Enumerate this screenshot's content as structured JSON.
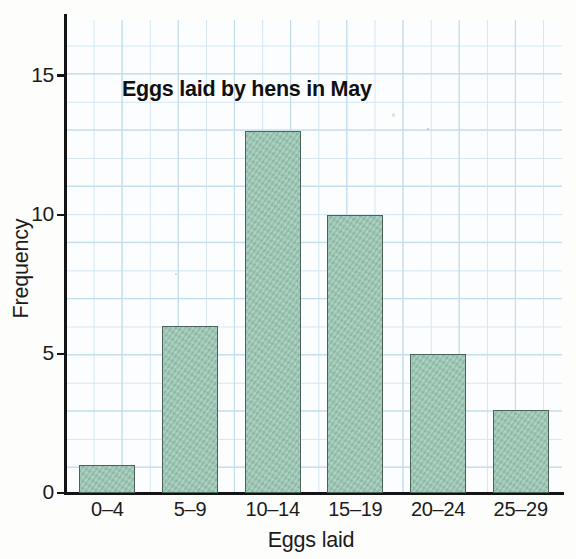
{
  "chart_data": {
    "type": "bar",
    "title": "Eggs laid by hens in May",
    "xlabel": "Eggs laid",
    "ylabel": "Frequency",
    "categories": [
      "0–4",
      "5–9",
      "10–14",
      "15–19",
      "20–24",
      "25–29"
    ],
    "values": [
      1,
      6,
      13,
      10,
      5,
      3
    ],
    "ylim": [
      0,
      17
    ],
    "yticks": [
      0,
      5,
      10,
      15
    ],
    "ytick_labels": [
      "0",
      "5",
      "10",
      "15"
    ],
    "grid": true,
    "grid_color": "#d3e6f2",
    "bar_color": "#97c4af",
    "bar_edge_color": "#4b6258",
    "axis_color": "#141414",
    "legend": null,
    "legend_position": "none",
    "background": "#fdfdfb"
  }
}
